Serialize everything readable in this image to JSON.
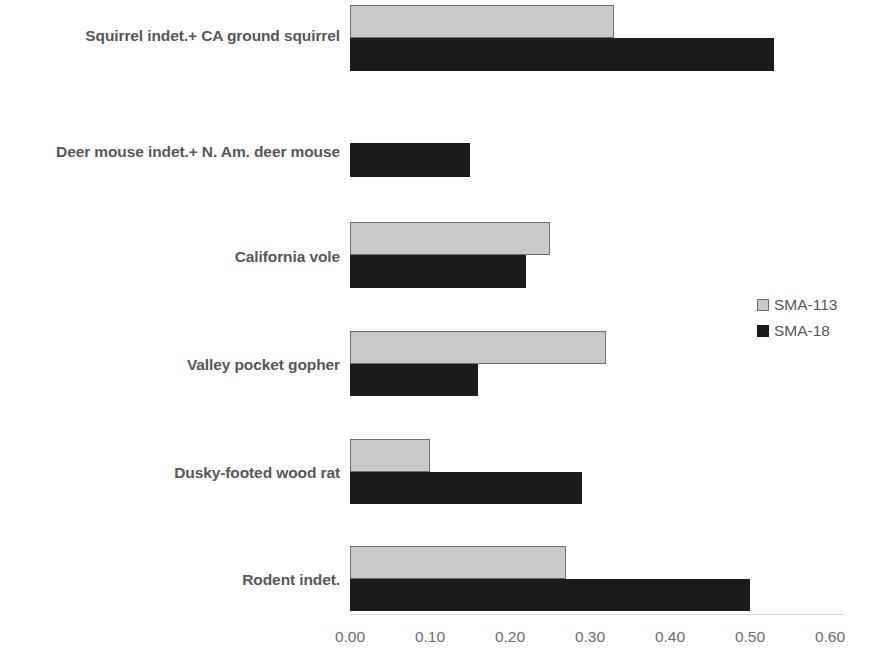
{
  "chart_data": {
    "type": "bar",
    "orientation": "horizontal",
    "title": "",
    "xlabel": "",
    "ylabel": "",
    "xlim": [
      0.0,
      0.6
    ],
    "xticks": [
      "0.00",
      "0.10",
      "0.20",
      "0.30",
      "0.40",
      "0.50",
      "0.60"
    ],
    "xtick_values": [
      0.0,
      0.1,
      0.2,
      0.3,
      0.4,
      0.5,
      0.6
    ],
    "grid": false,
    "legend_position": "right",
    "categories": [
      "Squirrel indet.+ CA ground squirrel",
      "Deer mouse indet.+ N. Am. deer mouse",
      "California vole",
      "Valley pocket gopher",
      "Dusky-footed wood rat",
      "Rodent indet."
    ],
    "series": [
      {
        "name": "SMA-113",
        "color": "#c9c9c9",
        "values": [
          0.33,
          0.0,
          0.25,
          0.32,
          0.1,
          0.27
        ]
      },
      {
        "name": "SMA-18",
        "color": "#1b1b1b",
        "values": [
          0.53,
          0.15,
          0.22,
          0.16,
          0.29,
          0.5
        ]
      }
    ]
  },
  "legend": {
    "items": [
      {
        "label": "SMA-113",
        "swatch": "light-gray-swatch"
      },
      {
        "label": "SMA-18",
        "swatch": "black-swatch"
      }
    ]
  },
  "colors": {
    "series_a": "#c9c9c9",
    "series_b": "#1b1b1b",
    "label_text": "#575757",
    "tick_text": "#6d6d6d",
    "background": "#ffffff"
  }
}
